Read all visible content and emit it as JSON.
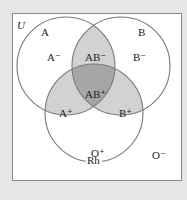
{
  "diagram": {
    "universe_label": "U",
    "sets": [
      {
        "name": "A",
        "label": "A"
      },
      {
        "name": "B",
        "label": "B"
      },
      {
        "name": "Rh",
        "label": "Rh"
      }
    ],
    "regions": {
      "a_only": "A⁻",
      "b_only": "B⁻",
      "ab_only": "AB⁻",
      "abrh": "AB⁺",
      "arh": "A⁺",
      "brh": "B⁺",
      "rh_only": "O⁺",
      "none": "O⁻"
    },
    "colors": {
      "background": "#e6e6e6",
      "box_fill": "#ffffff",
      "box_border": "#8a8a8a",
      "circle_stroke": "#7a7a7a",
      "pair_overlap": "#d2d2d2",
      "triple_overlap": "#a6a6a6"
    }
  }
}
